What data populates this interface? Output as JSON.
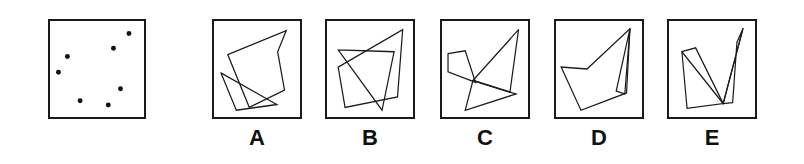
{
  "item": {
    "type": "spatial-reasoning-multiple-choice",
    "stem_label": "",
    "panel_count": 6
  },
  "stem": {
    "name": "dot-pattern-panel",
    "description": "Square frame containing seven filled dots",
    "viewbox": "0 0 100 100",
    "dot_radius": 2.6,
    "dot_color": "#121212",
    "frame_color": "#1a1a1a",
    "dots": [
      {
        "id": "dot-1",
        "x": 84.0,
        "y": 13.0
      },
      {
        "id": "dot-2",
        "x": 67.5,
        "y": 28.5
      },
      {
        "id": "dot-3",
        "x": 18.5,
        "y": 37.0
      },
      {
        "id": "dot-4",
        "x": 9.0,
        "y": 53.5
      },
      {
        "id": "dot-5",
        "x": 75.0,
        "y": 70.5
      },
      {
        "id": "dot-6",
        "x": 32.0,
        "y": 83.0
      },
      {
        "id": "dot-7",
        "x": 62.0,
        "y": 87.5
      }
    ]
  },
  "options": [
    {
      "label": "A",
      "name": "option-a",
      "viewbox": "0 0 100 100",
      "description": "Large arrowhead quadrilateral above a thin slanted triangle",
      "paths": [
        {
          "id": "a-poly-1",
          "points": "16,35 84,10 74,32 82,72 41,90 16,35"
        },
        {
          "id": "a-poly-2",
          "points": "8,54 73,87 26,93 8,54"
        }
      ]
    },
    {
      "label": "B",
      "name": "option-b",
      "viewbox": "0 0 100 100",
      "description": "Tilted quadrilateral overlapping a narrow triangle",
      "paths": [
        {
          "id": "b-poly-1",
          "points": "13,48 88,9 82,79 21,90 13,48"
        },
        {
          "id": "b-poly-2",
          "points": "13,30 78,32 64,93 13,30"
        }
      ]
    },
    {
      "label": "C",
      "name": "option-c",
      "viewbox": "0 0 100 100",
      "description": "Narrow spike triangle crossed by a small left wedge and a lower triangle",
      "paths": [
        {
          "id": "c-poly-1",
          "points": "89,9 79,74 36,62 89,9"
        },
        {
          "id": "c-poly-2",
          "points": "7,34 27,31 39,64 7,53 7,34"
        },
        {
          "id": "c-poly-3",
          "points": "36,62 86,76 27,93 36,62"
        }
      ]
    },
    {
      "label": "D",
      "name": "option-d",
      "viewbox": "0 0 100 100",
      "description": "Broad arrowhead polygon with a very thin sliver triangle on the right",
      "paths": [
        {
          "id": "d-poly-1",
          "points": "86,8 36,50 6,48 29,93 82,75 86,8"
        },
        {
          "id": "d-poly-2",
          "points": "86,8 80,76 70,73 86,8"
        }
      ]
    },
    {
      "label": "E",
      "name": "option-e",
      "viewbox": "0 0 100 100",
      "description": "V-shaped folded band with two narrow blades",
      "paths": [
        {
          "id": "e-poly-1",
          "points": "15,32 31,28 63,86 21,91 15,32"
        },
        {
          "id": "e-poly-2",
          "points": "86,8 79,22 74,85 63,86 86,8"
        },
        {
          "id": "e-poly-3",
          "points": "15,32 63,86 86,8"
        }
      ]
    }
  ]
}
